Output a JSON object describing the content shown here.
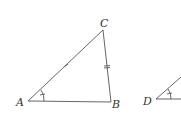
{
  "figure": {
    "triangle_abc": {
      "vertices": {
        "A": {
          "label": "A",
          "x": 28,
          "y": 101
        },
        "B": {
          "label": "B",
          "x": 111,
          "y": 102
        },
        "C": {
          "label": "C",
          "x": 103,
          "y": 30
        }
      },
      "marks": {
        "side_ac": "single tick",
        "side_bc": "double tick",
        "angle_a": "arc with single tick"
      }
    },
    "triangle_def_partial": {
      "vertices": {
        "D": {
          "label": "D",
          "x": 156,
          "y": 99
        }
      },
      "marks": {
        "angle_d": "arc with single tick"
      }
    },
    "colors": {
      "stroke": "#555555",
      "background": "#ffffff"
    }
  }
}
